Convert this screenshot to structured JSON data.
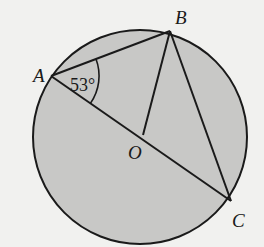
{
  "diagram": {
    "type": "circle-geometry",
    "colors": {
      "background": "#f1f1ef",
      "circle_fill": "#c8c8c6",
      "stroke": "#1a1a1a"
    },
    "circle": {
      "cx": 140,
      "cy": 137,
      "r": 107
    },
    "points": {
      "A": {
        "label": "A",
        "x": 51,
        "y": 76
      },
      "B": {
        "label": "B",
        "x": 170,
        "y": 31
      },
      "O": {
        "label": "O",
        "x": 143,
        "y": 135
      },
      "C": {
        "label": "C",
        "x": 231,
        "y": 201
      }
    },
    "segments": [
      {
        "from": "A",
        "to": "B"
      },
      {
        "from": "A",
        "to": "C"
      },
      {
        "from": "B",
        "to": "C"
      },
      {
        "from": "O",
        "to": "B"
      }
    ],
    "angle_marker": {
      "vertex": "A",
      "label": "53°",
      "value_degrees": 53
    }
  }
}
